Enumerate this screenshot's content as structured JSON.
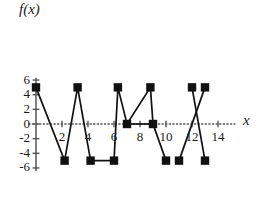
{
  "chart_data": {
    "type": "line",
    "title": "",
    "xlabel": "x",
    "ylabel": "f(x)",
    "xlim": [
      -0.6,
      15.4
    ],
    "ylim": [
      -6.6,
      6.4
    ],
    "grid": false,
    "legend": null,
    "marker": "square",
    "marker_color": "#111111",
    "line_color": "#111111",
    "axis_color": "#555555",
    "xticks": [
      2,
      4,
      6,
      8,
      10,
      12,
      14
    ],
    "xtick_labels": [
      "2",
      "4",
      "6",
      "8",
      "10",
      "12",
      "14"
    ],
    "yticks": [
      -6,
      -4,
      -2,
      0,
      2,
      4,
      6
    ],
    "ytick_labels": [
      "-6",
      "-4",
      "-2",
      "0",
      "2",
      "4",
      "6"
    ],
    "series": [
      {
        "name": "segment-1",
        "x": [
          0,
          2.2,
          3.2,
          4.2,
          6,
          6.3,
          7,
          8.8,
          9,
          10
        ],
        "y": [
          5,
          -5,
          5,
          -5,
          -5,
          5,
          0,
          5,
          0,
          -5
        ]
      },
      {
        "name": "segment-2",
        "x": [
          11,
          13
        ],
        "y": [
          -5,
          5
        ]
      },
      {
        "name": "segment-3",
        "x": [
          12,
          13
        ],
        "y": [
          5,
          -5
        ]
      },
      {
        "name": "segment-4",
        "x": [
          7,
          9
        ],
        "y": [
          0,
          0
        ]
      }
    ],
    "points": [
      {
        "x": 0,
        "y": 5
      },
      {
        "x": 2.2,
        "y": -5
      },
      {
        "x": 3.2,
        "y": 5
      },
      {
        "x": 4.2,
        "y": -5
      },
      {
        "x": 6,
        "y": -5
      },
      {
        "x": 6.3,
        "y": 5
      },
      {
        "x": 7,
        "y": 0
      },
      {
        "x": 8.8,
        "y": 5
      },
      {
        "x": 9,
        "y": 0
      },
      {
        "x": 10,
        "y": -5
      },
      {
        "x": 11,
        "y": -5
      },
      {
        "x": 12,
        "y": 5
      },
      {
        "x": 13,
        "y": 5
      },
      {
        "x": 13,
        "y": -5
      }
    ],
    "annotations": []
  }
}
